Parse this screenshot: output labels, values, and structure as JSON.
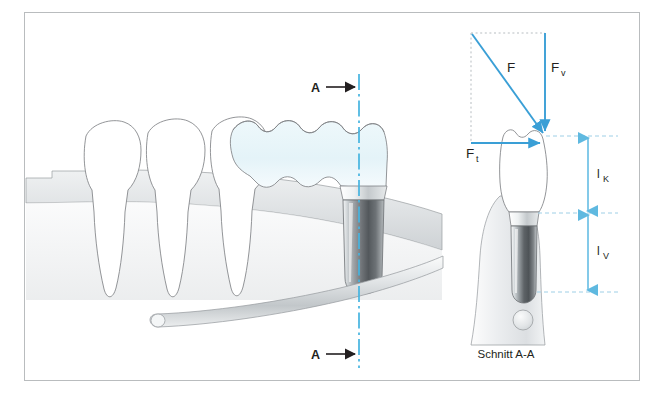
{
  "figure": {
    "caption": "Schnitt A-A",
    "section_marker_top": "A",
    "section_marker_bottom": "A",
    "colors": {
      "vector_blue": "#3a9fd6",
      "centerline_blue": "#45b4e0",
      "dimension_blue": "#7ec8e8",
      "outline_gray": "#7f8285",
      "tissue_gray": "#d7dadc",
      "implant_dark": "#4a4d50",
      "crown_tint": "#eaf6fa",
      "frame_gray": "#b9bcbe",
      "text_black": "#231f20"
    }
  },
  "force_diagram": {
    "resultant": {
      "symbol": "F",
      "subscript": ""
    },
    "vertical": {
      "symbol": "F",
      "subscript": "v"
    },
    "tangential": {
      "symbol": "F",
      "subscript": "t"
    }
  },
  "dimensions": [
    {
      "symbol": "l",
      "subscript": "K",
      "meaning": "crown-length"
    },
    {
      "symbol": "l",
      "subscript": "V",
      "meaning": "implant-anchorage-length"
    }
  ],
  "left_view": {
    "teeth_count": 3,
    "bridge_present": true,
    "implant_present": true,
    "nerve_canal_present": true
  },
  "right_view": {
    "title": "Schnitt A-A",
    "crown_present": true,
    "implant_present": true,
    "bone_present": true,
    "nerve_canal_section_present": true
  }
}
